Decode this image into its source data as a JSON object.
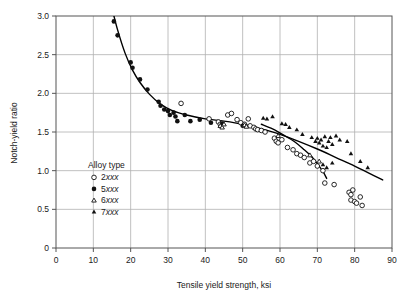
{
  "chart_data": {
    "type": "scatter",
    "title": "",
    "xlabel": "Tensile yield strength, ksi",
    "ylabel": "Notch-yield ratio",
    "xlim": [
      0,
      90
    ],
    "ylim": [
      0,
      3.0
    ],
    "xticks": [
      0,
      10,
      20,
      30,
      40,
      50,
      60,
      70,
      80,
      90
    ],
    "xtick_labels": [
      "0",
      "10",
      "20",
      "30",
      "40",
      "50",
      "60",
      "70",
      "80",
      "90"
    ],
    "yticks": [
      0,
      0.5,
      1.0,
      1.5,
      2.0,
      2.5,
      3.0
    ],
    "ytick_labels": [
      "0",
      "0.5",
      "1.0",
      "1.5",
      "2.0",
      "2.5",
      "3.0"
    ],
    "grid": true,
    "legend_position": "inside-lower-left",
    "legend_title": "Alloy type",
    "series": [
      {
        "name": "2xxx",
        "marker": "open-circle",
        "color": "#111111",
        "points": [
          [
            33.5,
            1.87
          ],
          [
            41.0,
            1.67
          ],
          [
            43.5,
            1.63
          ],
          [
            44.0,
            1.6
          ],
          [
            46.0,
            1.72
          ],
          [
            47.0,
            1.74
          ],
          [
            48.5,
            1.66
          ],
          [
            49.5,
            1.62
          ],
          [
            50.5,
            1.6
          ],
          [
            51.5,
            1.67
          ],
          [
            52.0,
            1.58
          ],
          [
            53.0,
            1.56
          ],
          [
            53.5,
            1.54
          ],
          [
            54.0,
            1.53
          ],
          [
            55.0,
            1.52
          ],
          [
            56.0,
            1.5
          ],
          [
            58.5,
            1.42
          ],
          [
            59.0,
            1.38
          ],
          [
            59.5,
            1.36
          ],
          [
            60.5,
            1.4
          ],
          [
            62.0,
            1.3
          ],
          [
            63.5,
            1.27
          ],
          [
            64.5,
            1.22
          ],
          [
            65.5,
            1.2
          ],
          [
            66.5,
            1.17
          ],
          [
            68.0,
            1.1
          ],
          [
            69.0,
            1.12
          ],
          [
            70.0,
            1.06
          ],
          [
            71.5,
            1.0
          ],
          [
            72.0,
            0.84
          ],
          [
            74.5,
            0.82
          ],
          [
            78.5,
            0.72
          ],
          [
            79.0,
            0.69
          ],
          [
            79.5,
            0.75
          ],
          [
            79.0,
            0.62
          ],
          [
            80.0,
            0.6
          ],
          [
            80.5,
            0.58
          ],
          [
            81.5,
            0.66
          ],
          [
            82.0,
            0.55
          ]
        ]
      },
      {
        "name": "5xxx",
        "marker": "filled-circle",
        "color": "#111111",
        "points": [
          [
            15.5,
            2.93
          ],
          [
            16.5,
            2.75
          ],
          [
            20.0,
            2.4
          ],
          [
            20.5,
            2.33
          ],
          [
            22.5,
            2.18
          ],
          [
            24.5,
            2.05
          ],
          [
            27.5,
            1.89
          ],
          [
            28.0,
            1.84
          ],
          [
            29.0,
            1.79
          ],
          [
            30.0,
            1.77
          ],
          [
            30.5,
            1.72
          ],
          [
            31.5,
            1.75
          ],
          [
            32.0,
            1.7
          ],
          [
            32.5,
            1.64
          ],
          [
            34.5,
            1.72
          ],
          [
            36.0,
            1.64
          ],
          [
            38.5,
            1.66
          ],
          [
            41.5,
            1.62
          ],
          [
            44.5,
            1.61
          ],
          [
            50.0,
            1.58
          ]
        ]
      },
      {
        "name": "6xxx",
        "marker": "open-triangle",
        "color": "#111111",
        "points": [
          [
            44.0,
            1.58
          ],
          [
            44.5,
            1.56
          ],
          [
            45.0,
            1.6
          ],
          [
            50.5,
            1.59
          ],
          [
            51.0,
            1.57
          ],
          [
            59.5,
            1.45
          ],
          [
            68.0,
            1.2
          ],
          [
            70.5,
            1.12
          ]
        ]
      },
      {
        "name": "7xxx",
        "marker": "filled-triangle",
        "color": "#111111",
        "points": [
          [
            55.5,
            1.68
          ],
          [
            56.5,
            1.67
          ],
          [
            58.0,
            1.7
          ],
          [
            60.5,
            1.61
          ],
          [
            61.5,
            1.6
          ],
          [
            62.5,
            1.56
          ],
          [
            64.5,
            1.53
          ],
          [
            66.0,
            1.47
          ],
          [
            68.5,
            1.43
          ],
          [
            69.5,
            1.38
          ],
          [
            70.0,
            1.42
          ],
          [
            70.5,
            1.36
          ],
          [
            71.0,
            1.4
          ],
          [
            71.5,
            1.32
          ],
          [
            72.0,
            1.44
          ],
          [
            72.5,
            1.3
          ],
          [
            73.0,
            1.38
          ],
          [
            73.5,
            1.43
          ],
          [
            74.0,
            1.34
          ],
          [
            75.0,
            1.45
          ],
          [
            76.0,
            1.4
          ],
          [
            71.5,
            1.08
          ],
          [
            72.5,
            1.04
          ],
          [
            74.0,
            1.1
          ],
          [
            78.0,
            1.38
          ],
          [
            79.0,
            1.22
          ],
          [
            81.5,
            1.12
          ],
          [
            83.5,
            1.04
          ]
        ]
      }
    ],
    "trend_curves": [
      {
        "name": "upper-trend",
        "points": [
          [
            15.0,
            3.1
          ],
          [
            16.5,
            2.82
          ],
          [
            18.5,
            2.52
          ],
          [
            20.5,
            2.3
          ],
          [
            22.5,
            2.14
          ],
          [
            25.0,
            1.99
          ],
          [
            28.0,
            1.86
          ],
          [
            31.0,
            1.78
          ],
          [
            35.0,
            1.72
          ],
          [
            40.0,
            1.67
          ],
          [
            45.0,
            1.64
          ],
          [
            50.0,
            1.6
          ],
          [
            55.0,
            1.54
          ],
          [
            60.0,
            1.47
          ],
          [
            65.0,
            1.38
          ],
          [
            70.0,
            1.28
          ],
          [
            75.0,
            1.17
          ],
          [
            80.0,
            1.06
          ],
          [
            85.0,
            0.94
          ],
          [
            87.5,
            0.88
          ]
        ]
      },
      {
        "name": "lower-trend",
        "points": [
          [
            55.0,
            1.6
          ],
          [
            58.0,
            1.54
          ],
          [
            61.0,
            1.46
          ],
          [
            64.0,
            1.37
          ],
          [
            66.5,
            1.27
          ],
          [
            68.5,
            1.18
          ],
          [
            70.0,
            1.09
          ],
          [
            71.5,
            0.99
          ],
          [
            72.5,
            0.9
          ]
        ]
      }
    ]
  },
  "legend": {
    "title": "Alloy type",
    "entries": [
      {
        "label": "2",
        "suffix": "xxx",
        "marker": "open-circle"
      },
      {
        "label": "5",
        "suffix": "xxx",
        "marker": "filled-circle"
      },
      {
        "label": "6",
        "suffix": "xxx",
        "marker": "open-triangle"
      },
      {
        "label": "7",
        "suffix": "xxx",
        "marker": "filled-triangle"
      }
    ]
  },
  "colors": {
    "grid": "#b0b0b0",
    "axis": "#555555",
    "marker": "#111111",
    "curve": "#000000",
    "text": "#1a1a1a",
    "background": "#ffffff"
  }
}
